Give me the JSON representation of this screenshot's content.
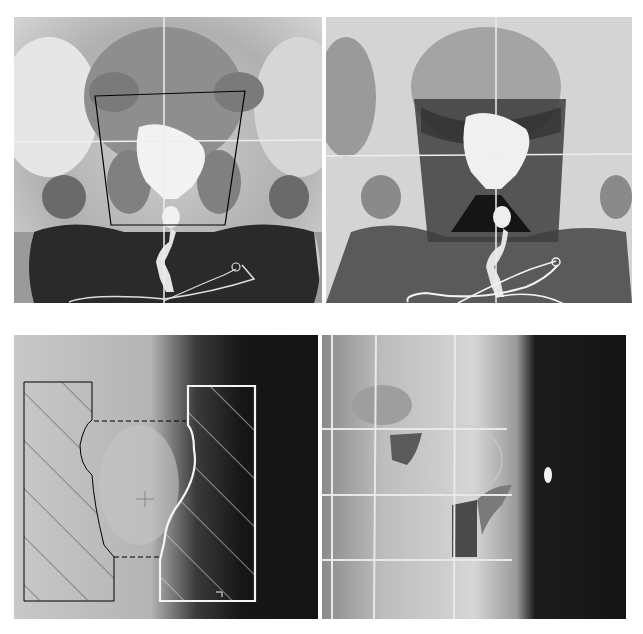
{
  "figure": {
    "layout": "2x2 grid of grayscale pelvic radiographs",
    "background": "#ffffff",
    "panels": [
      {
        "id": "top-left",
        "description": "AP pelvic radiograph with contrast-filled bladder and urethra; black trapezoid outline marks the treatment field",
        "overlay": "black trapezoid outline",
        "crosshair": true
      },
      {
        "id": "top-right",
        "description": "Same AP pelvic radiograph with darker shaded trapezoidal treatment field",
        "overlay": "dark shaded field",
        "crosshair": true
      },
      {
        "id": "bottom-left",
        "description": "Lateral pelvic radiograph with two hatched shielding blocks (black outline left, white outline right) joined by dashed lines",
        "overlay": "hatched shielding blocks",
        "crosshair": false
      },
      {
        "id": "bottom-right",
        "description": "Lateral port film with grid lines and darker shielded field region",
        "overlay": "grid lines",
        "crosshair": false
      }
    ]
  },
  "colors": {
    "film_light": "#e8e8e8",
    "film_mid": "#8a8a8a",
    "film_dark": "#1e1e1e",
    "outline_black": "#000000",
    "outline_white": "#f4f4f4"
  }
}
